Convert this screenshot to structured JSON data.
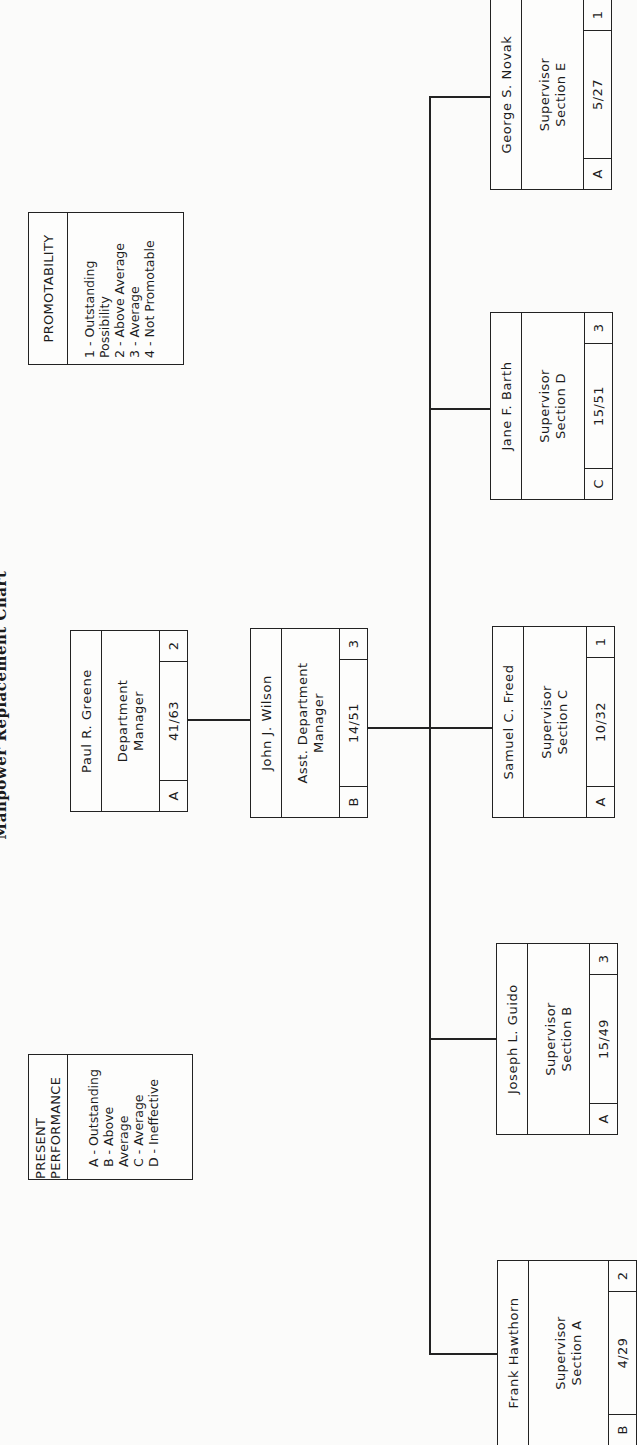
{
  "title": "Manpower Replacement Chart",
  "legends": {
    "performance": {
      "heading": "PRESENT PERFORMANCE",
      "items": [
        "A - Outstanding",
        "B - Above Average",
        "C - Average",
        "D - Ineffective"
      ]
    },
    "promotability": {
      "heading": "PROMOTABILITY",
      "items": [
        "1 - Outstanding Possibility",
        "2 - Above Average",
        "3 - Average",
        "4 - Not Promotable"
      ]
    }
  },
  "nodes": {
    "greene": {
      "name": "Paul R. Greene",
      "role1": "Department",
      "role2": "Manager",
      "perf": "A",
      "ratio": "41/63",
      "promo": "2"
    },
    "wilson": {
      "name": "John J. Wilson",
      "role1": "Asst. Department",
      "role2": "Manager",
      "perf": "B",
      "ratio": "14/51",
      "promo": "3"
    },
    "hawthorn": {
      "name": "Frank Hawthorn",
      "role1": "Supervisor",
      "role2": "Section A",
      "perf": "B",
      "ratio": "4/29",
      "promo": "2"
    },
    "guido": {
      "name": "Joseph L. Guido",
      "role1": "Supervisor",
      "role2": "Section B",
      "perf": "A",
      "ratio": "15/49",
      "promo": "3"
    },
    "freed": {
      "name": "Samuel C. Freed",
      "role1": "Supervisor",
      "role2": "Section C",
      "perf": "A",
      "ratio": "10/32",
      "promo": "1"
    },
    "barth": {
      "name": "Jane F. Barth",
      "role1": "Supervisor",
      "role2": "Section D",
      "perf": "C",
      "ratio": "15/51",
      "promo": "3"
    },
    "novak": {
      "name": "George S. Novak",
      "role1": "Supervisor",
      "role2": "Section E",
      "perf": "A",
      "ratio": "5/27",
      "promo": "1"
    }
  }
}
